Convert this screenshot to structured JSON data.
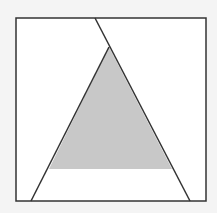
{
  "diagram": {
    "colors": {
      "background": "#f4f4f4",
      "square_fill": "#ffffff",
      "stroke": "#333333",
      "shade": "#c8c8c8"
    },
    "square": {
      "x": 16,
      "y": 18,
      "width": 190,
      "height": 183
    },
    "shaded_triangle": {
      "apex": [
        109,
        47
      ],
      "base_left": [
        49,
        169
      ],
      "base_right": [
        172,
        169
      ]
    },
    "left_line": {
      "from": [
        109,
        47
      ],
      "to": [
        31,
        201
      ]
    },
    "right_line": {
      "from": [
        95,
        18
      ],
      "to": [
        190,
        201
      ]
    }
  }
}
